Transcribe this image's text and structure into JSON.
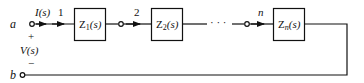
{
  "diagram": {
    "type": "series-impedance-circuit",
    "colors": {
      "stroke": "#111111",
      "background": "#ffffff"
    },
    "terminals": {
      "a": {
        "label": "a"
      },
      "b": {
        "label": "b"
      }
    },
    "source": {
      "current_label": "I(s)",
      "voltage_label": "V(s)",
      "plus": "+",
      "minus": "−"
    },
    "nodes": [
      {
        "label": "1"
      },
      {
        "label": "2"
      },
      {
        "label": "n"
      }
    ],
    "blocks": [
      {
        "label": "Z",
        "sub": "1",
        "arg": "(s)"
      },
      {
        "label": "Z",
        "sub": "2",
        "arg": "(s)"
      },
      {
        "label": "Z",
        "sub": "n",
        "arg": "(s)"
      }
    ],
    "ellipsis": "· · ·"
  }
}
